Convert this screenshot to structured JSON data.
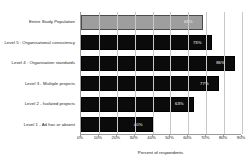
{
  "chart_data": {
    "type": "bar",
    "orientation": "horizontal",
    "title": "",
    "xlabel": "Percent of respondents",
    "ylabel": "",
    "xlim": [
      0,
      90
    ],
    "grid": true,
    "legend": "none",
    "categories": [
      "Entire Study Population",
      "Level 5 : Organisational consistency",
      "Level 4 : Organisation standards",
      "Level 3 - Multiple projects",
      "Level 2 - Isolated projects",
      "Level 1 - Ad hoc or absent"
    ],
    "values": [
      68,
      73,
      86,
      77,
      63,
      40
    ],
    "value_labels": [
      "68%",
      "73%",
      "86%",
      "77%",
      "63%",
      "40%"
    ],
    "bar_colors": [
      "#9e9e9e",
      "#0b0b0b",
      "#0b0b0b",
      "#0b0b0b",
      "#0b0b0b",
      "#0b0b0b"
    ],
    "highlight_index": 0,
    "xticks": [
      0,
      10,
      20,
      30,
      40,
      50,
      60,
      70,
      80,
      90
    ],
    "xtick_labels": [
      "0%",
      "10%",
      "20%",
      "30%",
      "40%",
      "50%",
      "60%",
      "70%",
      "80%",
      "90%"
    ]
  }
}
